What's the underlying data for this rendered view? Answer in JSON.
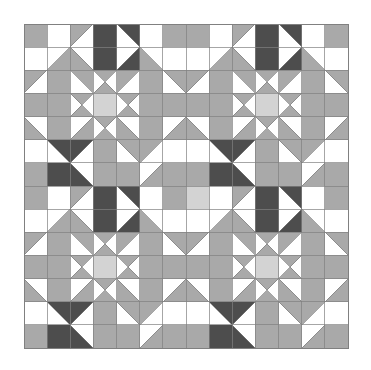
{
  "artwork": {
    "title": "Bear Paw Quilt Block Sampler",
    "kind": "quilt-pattern",
    "background_color": "#ffffff",
    "seam_line_color": "#808080",
    "seam_line_width": 0.7,
    "outer_border_color": "#808080",
    "outer_border_width": 1.0
  },
  "palette": {
    "light": "#d3d3d3",
    "medium": "#a9a9a9",
    "dark": "#4d4d4d",
    "white": "#ffffff",
    "line": "#808080"
  },
  "palette_labels": {
    "light": "Light Grey",
    "medium": "Medium Grey",
    "dark": "Dark Charcoal",
    "white": "White"
  },
  "geometry": {
    "canvas_width": 371,
    "canvas_height": 370,
    "quilt_x": 24,
    "quilt_y": 24,
    "quilt_size": 324,
    "grid_cells": 14,
    "cell_size": 23.142857,
    "blocks_across": 2,
    "blocks_down": 2,
    "block_cells": 7
  },
  "block": {
    "name": "Bear Paw",
    "unit_grid": 7,
    "description": "Four bear paws around a light square centre with sashing-style hourglass units",
    "cells": [
      {
        "c": 0,
        "r": 0,
        "type": "solid",
        "fill": "medium"
      },
      {
        "c": 1,
        "r": 0,
        "type": "solid",
        "fill": "white"
      },
      {
        "c": 2,
        "r": 0,
        "type": "hst",
        "fill": "medium",
        "bg": "white",
        "orient": "tl"
      },
      {
        "c": 3,
        "r": 0,
        "type": "solid",
        "fill": "dark"
      },
      {
        "c": 4,
        "r": 0,
        "type": "hst",
        "fill": "dark",
        "bg": "white",
        "orient": "tr"
      },
      {
        "c": 5,
        "r": 0,
        "type": "solid",
        "fill": "white"
      },
      {
        "c": 6,
        "r": 0,
        "type": "solid",
        "fill": "medium"
      },
      {
        "c": 0,
        "r": 1,
        "type": "solid",
        "fill": "white"
      },
      {
        "c": 1,
        "r": 1,
        "type": "hst",
        "fill": "medium",
        "bg": "white",
        "orient": "br"
      },
      {
        "c": 2,
        "r": 1,
        "type": "hst",
        "fill": "medium",
        "bg": "white",
        "orient": "bl"
      },
      {
        "c": 3,
        "r": 1,
        "type": "solid",
        "fill": "dark"
      },
      {
        "c": 4,
        "r": 1,
        "type": "hst",
        "fill": "dark",
        "bg": "white",
        "orient": "br"
      },
      {
        "c": 5,
        "r": 1,
        "type": "hst",
        "fill": "medium",
        "bg": "white",
        "orient": "bl"
      },
      {
        "c": 6,
        "r": 1,
        "type": "solid",
        "fill": "white"
      },
      {
        "c": 0,
        "r": 2,
        "type": "hst",
        "fill": "medium",
        "bg": "white",
        "orient": "tl"
      },
      {
        "c": 1,
        "r": 2,
        "type": "solid",
        "fill": "medium"
      },
      {
        "c": 2,
        "r": 2,
        "type": "hst",
        "fill": "medium",
        "bg": "white",
        "orient": "tr"
      },
      {
        "c": 3,
        "r": 2,
        "type": "hourglass",
        "fill": "medium",
        "bg": "white"
      },
      {
        "c": 4,
        "r": 2,
        "type": "hst",
        "fill": "medium",
        "bg": "white",
        "orient": "tl"
      },
      {
        "c": 5,
        "r": 2,
        "type": "solid",
        "fill": "medium"
      },
      {
        "c": 6,
        "r": 2,
        "type": "hst",
        "fill": "medium",
        "bg": "white",
        "orient": "tr"
      },
      {
        "c": 0,
        "r": 3,
        "type": "solid",
        "fill": "medium"
      },
      {
        "c": 1,
        "r": 3,
        "type": "solid",
        "fill": "medium"
      },
      {
        "c": 2,
        "r": 3,
        "type": "hourglass",
        "fill": "medium",
        "bg": "white"
      },
      {
        "c": 3,
        "r": 3,
        "type": "solid",
        "fill": "light"
      },
      {
        "c": 4,
        "r": 3,
        "type": "hourglass",
        "fill": "medium",
        "bg": "white"
      },
      {
        "c": 5,
        "r": 3,
        "type": "solid",
        "fill": "medium"
      },
      {
        "c": 6,
        "r": 3,
        "type": "solid",
        "fill": "medium"
      },
      {
        "c": 0,
        "r": 4,
        "type": "hst",
        "fill": "medium",
        "bg": "white",
        "orient": "bl"
      },
      {
        "c": 1,
        "r": 4,
        "type": "solid",
        "fill": "medium"
      },
      {
        "c": 2,
        "r": 4,
        "type": "hst",
        "fill": "medium",
        "bg": "white",
        "orient": "br"
      },
      {
        "c": 3,
        "r": 4,
        "type": "hourglass",
        "fill": "medium",
        "bg": "white"
      },
      {
        "c": 4,
        "r": 4,
        "type": "hst",
        "fill": "medium",
        "bg": "white",
        "orient": "bl"
      },
      {
        "c": 5,
        "r": 4,
        "type": "solid",
        "fill": "medium"
      },
      {
        "c": 6,
        "r": 4,
        "type": "hst",
        "fill": "medium",
        "bg": "white",
        "orient": "br"
      },
      {
        "c": 0,
        "r": 5,
        "type": "solid",
        "fill": "white"
      },
      {
        "c": 1,
        "r": 5,
        "type": "hst",
        "fill": "dark",
        "bg": "white",
        "orient": "tr"
      },
      {
        "c": 2,
        "r": 5,
        "type": "hst",
        "fill": "dark",
        "bg": "white",
        "orient": "tl"
      },
      {
        "c": 3,
        "r": 5,
        "type": "solid",
        "fill": "medium"
      },
      {
        "c": 4,
        "r": 5,
        "type": "hst",
        "fill": "medium",
        "bg": "white",
        "orient": "tr"
      },
      {
        "c": 5,
        "r": 5,
        "type": "hst",
        "fill": "medium",
        "bg": "white",
        "orient": "tl"
      },
      {
        "c": 6,
        "r": 5,
        "type": "solid",
        "fill": "white"
      },
      {
        "c": 0,
        "r": 6,
        "type": "solid",
        "fill": "medium"
      },
      {
        "c": 1,
        "r": 6,
        "type": "solid",
        "fill": "dark"
      },
      {
        "c": 2,
        "r": 6,
        "type": "hst",
        "fill": "dark",
        "bg": "white",
        "orient": "bl"
      },
      {
        "c": 3,
        "r": 6,
        "type": "solid",
        "fill": "medium"
      },
      {
        "c": 4,
        "r": 6,
        "type": "solid",
        "fill": "medium"
      },
      {
        "c": 5,
        "r": 6,
        "type": "hst",
        "fill": "medium",
        "bg": "white",
        "orient": "br"
      },
      {
        "c": 6,
        "r": 6,
        "type": "solid",
        "fill": "medium"
      }
    ]
  },
  "blocks": [
    {
      "name": "block-top-left",
      "col": 0,
      "row": 0,
      "rotation": 0
    },
    {
      "name": "block-top-right",
      "col": 1,
      "row": 0,
      "rotation": 0
    },
    {
      "name": "block-bottom-left",
      "col": 0,
      "row": 1,
      "rotation": 0
    },
    {
      "name": "block-bottom-right",
      "col": 1,
      "row": 1,
      "rotation": 0
    }
  ],
  "overrides": [
    {
      "c": 7,
      "r": 0,
      "type": "solid",
      "fill": "medium"
    },
    {
      "c": 0,
      "r": 7,
      "type": "solid",
      "fill": "medium"
    },
    {
      "c": 7,
      "r": 7,
      "type": "solid",
      "fill": "light"
    },
    {
      "c": 6,
      "r": 6,
      "type": "solid",
      "fill": "medium"
    },
    {
      "c": 3,
      "r": 10,
      "type": "solid",
      "fill": "light"
    },
    {
      "c": 10,
      "r": 3,
      "type": "solid",
      "fill": "light"
    },
    {
      "c": 10,
      "r": 10,
      "type": "solid",
      "fill": "light"
    },
    {
      "c": 3,
      "r": 3,
      "type": "solid",
      "fill": "light"
    }
  ]
}
